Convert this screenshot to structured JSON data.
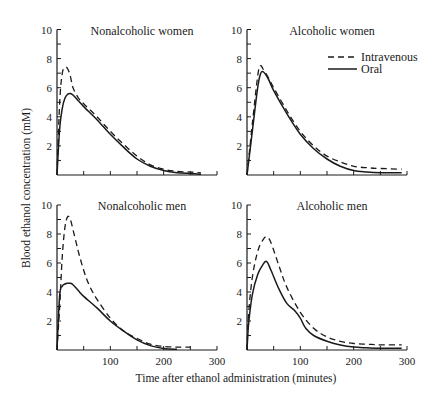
{
  "figure": {
    "ylabel": "Blood ethanol concentration (mM)",
    "xlabel": "Time after ethanol administration (minutes)",
    "legend": {
      "items": [
        {
          "label": "Intravenous",
          "style": "dashed"
        },
        {
          "label": "Oral",
          "style": "solid"
        }
      ]
    },
    "panels": [
      {
        "title": "Nonalcoholic women"
      },
      {
        "title": "Alcoholic women"
      },
      {
        "title": "Nonalcoholic men"
      },
      {
        "title": "Alcoholic men"
      }
    ],
    "yticks": [
      "2",
      "4",
      "6",
      "8",
      "10"
    ],
    "xticks": [
      "100",
      "200",
      "300"
    ]
  },
  "chart_data": [
    {
      "type": "line",
      "title": "Nonalcoholic women",
      "xlabel": "Time after ethanol administration (minutes)",
      "ylabel": "Blood ethanol concentration (mM)",
      "xlim": [
        0,
        300
      ],
      "ylim": [
        0,
        10
      ],
      "xticks": [
        100,
        200,
        300
      ],
      "yticks": [
        2,
        4,
        6,
        8,
        10
      ],
      "series": [
        {
          "name": "Intravenous",
          "style": "dashed",
          "x": [
            0,
            5,
            10,
            15,
            20,
            25,
            30,
            40,
            50,
            75,
            100,
            125,
            150,
            175,
            200,
            225,
            250,
            270
          ],
          "y": [
            0,
            5.0,
            7.0,
            7.4,
            7.3,
            6.8,
            6.0,
            5.3,
            4.9,
            4.0,
            3.0,
            2.1,
            1.3,
            0.7,
            0.4,
            0.25,
            0.2,
            0.15
          ]
        },
        {
          "name": "Oral",
          "style": "solid",
          "x": [
            0,
            5,
            10,
            15,
            20,
            25,
            30,
            40,
            50,
            75,
            100,
            125,
            150,
            175,
            200,
            225,
            250,
            270
          ],
          "y": [
            0,
            3.2,
            4.6,
            5.3,
            5.55,
            5.6,
            5.5,
            5.1,
            4.7,
            3.8,
            2.8,
            1.9,
            1.1,
            0.6,
            0.3,
            0.15,
            0.1,
            0.05
          ]
        }
      ]
    },
    {
      "type": "line",
      "title": "Alcoholic women",
      "xlabel": "Time after ethanol administration (minutes)",
      "ylabel": "Blood ethanol concentration (mM)",
      "xlim": [
        0,
        300
      ],
      "ylim": [
        0,
        10
      ],
      "xticks": [
        100,
        200,
        300
      ],
      "yticks": [
        2,
        4,
        6,
        8,
        10
      ],
      "series": [
        {
          "name": "Intravenous",
          "style": "dashed",
          "x": [
            0,
            10,
            20,
            25,
            30,
            40,
            50,
            75,
            100,
            125,
            150,
            175,
            200,
            225,
            250,
            290
          ],
          "y": [
            0,
            3.5,
            6.8,
            7.5,
            7.3,
            6.7,
            6.0,
            4.4,
            3.0,
            2.0,
            1.3,
            0.9,
            0.6,
            0.5,
            0.45,
            0.4
          ]
        },
        {
          "name": "Oral",
          "style": "solid",
          "x": [
            0,
            10,
            20,
            25,
            30,
            40,
            50,
            75,
            100,
            125,
            150,
            175,
            200,
            225,
            250,
            290
          ],
          "y": [
            0,
            3.0,
            6.0,
            6.9,
            7.1,
            6.6,
            5.8,
            4.2,
            2.8,
            1.8,
            1.1,
            0.6,
            0.3,
            0.2,
            0.15,
            0.15
          ]
        }
      ]
    },
    {
      "type": "line",
      "title": "Nonalcoholic men",
      "xlabel": "Time after ethanol administration (minutes)",
      "ylabel": "Blood ethanol concentration (mM)",
      "xlim": [
        0,
        300
      ],
      "ylim": [
        0,
        10
      ],
      "xticks": [
        100,
        200,
        300
      ],
      "yticks": [
        2,
        4,
        6,
        8,
        10
      ],
      "series": [
        {
          "name": "Intravenous",
          "style": "dashed",
          "x": [
            0,
            5,
            10,
            15,
            20,
            25,
            30,
            40,
            50,
            60,
            75,
            100,
            125,
            150,
            175,
            200,
            225,
            250
          ],
          "y": [
            0,
            3.0,
            6.5,
            8.5,
            9.2,
            9.0,
            8.3,
            6.8,
            5.5,
            4.5,
            3.5,
            2.2,
            1.3,
            0.8,
            0.4,
            0.25,
            0.2,
            0.2
          ]
        },
        {
          "name": "Oral",
          "style": "solid",
          "x": [
            0,
            5,
            10,
            15,
            20,
            25,
            30,
            40,
            50,
            75,
            100,
            125,
            150,
            175,
            200,
            225
          ],
          "y": [
            0,
            3.8,
            4.4,
            4.55,
            4.6,
            4.6,
            4.5,
            4.1,
            3.7,
            2.9,
            2.0,
            1.3,
            0.7,
            0.3,
            0.1,
            0.05
          ]
        }
      ]
    },
    {
      "type": "line",
      "title": "Alcoholic men",
      "xlabel": "Time after ethanol administration (minutes)",
      "ylabel": "Blood ethanol concentration (mM)",
      "xlim": [
        0,
        300
      ],
      "ylim": [
        0,
        10
      ],
      "xticks": [
        100,
        200,
        300
      ],
      "yticks": [
        2,
        4,
        6,
        8,
        10
      ],
      "series": [
        {
          "name": "Intravenous",
          "style": "dashed",
          "x": [
            0,
            3,
            10,
            20,
            30,
            37,
            45,
            60,
            75,
            100,
            125,
            150,
            175,
            200,
            225,
            250,
            290
          ],
          "y": [
            0,
            2.5,
            5.0,
            6.8,
            7.6,
            7.8,
            7.4,
            5.8,
            4.3,
            2.6,
            1.5,
            0.9,
            0.6,
            0.45,
            0.4,
            0.35,
            0.35
          ]
        },
        {
          "name": "Oral",
          "style": "solid",
          "x": [
            0,
            3,
            10,
            20,
            30,
            37,
            45,
            60,
            75,
            90,
            100,
            110,
            125,
            150,
            175,
            200,
            225,
            250,
            290
          ],
          "y": [
            0,
            1.8,
            3.8,
            5.2,
            5.9,
            6.1,
            5.5,
            4.2,
            3.2,
            2.7,
            2.2,
            1.5,
            1.0,
            0.6,
            0.35,
            0.2,
            0.15,
            0.12,
            0.12
          ]
        }
      ]
    }
  ]
}
